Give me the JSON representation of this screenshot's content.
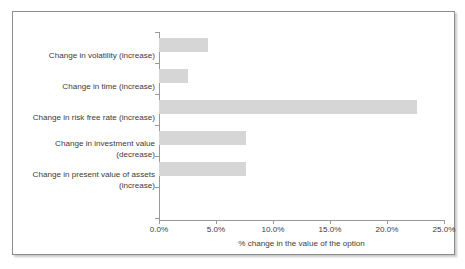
{
  "chart_data": {
    "type": "bar",
    "orientation": "horizontal",
    "title": "",
    "xlabel": "% change in the value of the option",
    "ylabel": "",
    "categories": [
      "Change in volatility (increase)",
      "Change in time (increase)",
      "Change in risk free rate (increase)",
      "Change in investment value\n(decrease)",
      "Change in present value of assets\n(increase)"
    ],
    "values": [
      4.3,
      2.5,
      22.6,
      7.6,
      7.6
    ],
    "xlim": [
      0,
      25
    ],
    "xticks": [
      0,
      5,
      10,
      15,
      20,
      25
    ],
    "xtick_labels": [
      "0.0%",
      "5.0%",
      "10.0%",
      "15.0%",
      "20.0%",
      "25.0%"
    ],
    "grid": false,
    "legend": false,
    "bar_color": "#d6d6d6",
    "axis_color": "#9a9a9a",
    "text_color": "#3b3b3b",
    "frame_border_color": "#8d8d8d",
    "background_color": "#ffffff"
  }
}
